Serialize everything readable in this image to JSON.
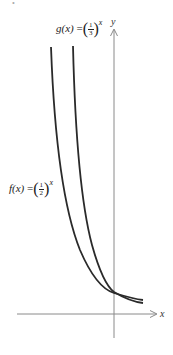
{
  "figure": {
    "corner_mark": "•",
    "axes": {
      "x_label": "x",
      "y_label": "y"
    },
    "functions": {
      "g": {
        "name": "g(x)",
        "equals": "=",
        "base_numerator": "1",
        "base_denominator": "3",
        "exponent": "x",
        "open_paren": "(",
        "close_paren": ")"
      },
      "f": {
        "name": "f(x)",
        "equals": "=",
        "base_numerator": "1",
        "base_denominator": "2",
        "exponent": "x",
        "open_paren": "(",
        "close_paren": ")"
      }
    },
    "colors": {
      "curve": "#2a2a2a",
      "axis": "#8a8a8a",
      "text": "#222222"
    }
  }
}
